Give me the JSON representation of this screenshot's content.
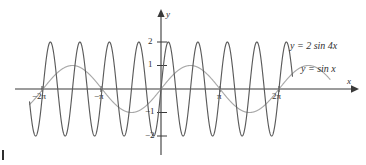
{
  "figure": {
    "background_color": "#ffffff"
  },
  "axes": {
    "x_axis_name": "x",
    "y_axis_name": "y",
    "x_ticks": [
      {
        "label": "−2π",
        "value": -6.2832
      },
      {
        "label": "−π",
        "value": -3.1416
      },
      {
        "label": "π",
        "value": 3.1416
      },
      {
        "label": "2π",
        "value": 6.2832
      }
    ],
    "y_ticks": [
      {
        "label": "2",
        "value": 2
      },
      {
        "label": "1",
        "value": 1
      },
      {
        "label": "−1",
        "value": -1
      },
      {
        "label": "−2",
        "value": -2
      }
    ]
  },
  "curve_labels": {
    "fast": "y = 2 sin 4x",
    "slow": "y = sin x"
  },
  "colors": {
    "curve_fast": "#5b5b5b",
    "curve_slow": "#a8a8a8",
    "axis": "#3a3a3a",
    "text": "#2f2f2f"
  },
  "chart_data": {
    "type": "line",
    "title": "",
    "xlabel": "x",
    "ylabel": "y",
    "xlim": [
      -7.8,
      9.0
    ],
    "ylim": [
      -2.6,
      2.9
    ],
    "grid": false,
    "legend": "inline-right",
    "x_tick_labels": [
      "−2π",
      "−π",
      "π",
      "2π"
    ],
    "x_tick_values": [
      -6.2832,
      -3.1416,
      3.1416,
      6.2832
    ],
    "y_tick_labels": [
      "2",
      "1",
      "−1",
      "−2"
    ],
    "y_tick_values": [
      2,
      1,
      -1,
      -2
    ],
    "series": [
      {
        "name": "y = 2 sin 4x",
        "expression": "2*sin(4*x)",
        "amplitude": 2,
        "frequency": 4,
        "period": 1.5708,
        "color": "#5b5b5b",
        "x_start": -7.0,
        "x_end": 7.0
      },
      {
        "name": "y = sin x",
        "expression": "sin(x)",
        "amplitude": 1,
        "frequency": 1,
        "period": 6.2832,
        "color": "#a8a8a8",
        "x_start": -7.0,
        "x_end": 9.0
      }
    ],
    "annotations": [
      {
        "text": "y = 2 sin 4x",
        "x": 7.3,
        "y": 1.85
      },
      {
        "text": "y = sin x",
        "x": 7.8,
        "y": 0.9
      }
    ]
  }
}
